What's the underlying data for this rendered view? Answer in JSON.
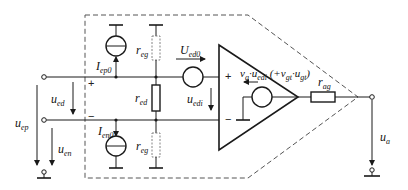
{
  "diagram": {
    "type": "op-amp equivalent circuit with offset sources",
    "colors": {
      "line": "#1a1a1a",
      "dashed": "#555555",
      "background": "#ffffff"
    },
    "labels": {
      "iep0": {
        "main": "I",
        "sub": "ep0"
      },
      "ien0": {
        "main": "I",
        "sub": "en0"
      },
      "reg_top": {
        "main": "r",
        "sub": "eg"
      },
      "reg_bottom": {
        "main": "r",
        "sub": "eg"
      },
      "red": {
        "main": "r",
        "sub": "ed"
      },
      "ued0": {
        "main": "U",
        "sub": "ed0"
      },
      "uedi": {
        "main": "u",
        "sub": "edi"
      },
      "ued": {
        "main": "u",
        "sub": "ed"
      },
      "uep": {
        "main": "u",
        "sub": "ep"
      },
      "uen": {
        "main": "u",
        "sub": "en"
      },
      "ua": {
        "main": "u",
        "sub": "a"
      },
      "rag": {
        "main": "r",
        "sub": "ag"
      },
      "gain_expr": "v_g·u_edi (+v_gt·u_gt)",
      "gain_main": "v",
      "gain_sub1": "g",
      "gain_mid": "·u",
      "gain_sub2": "edi",
      "gain_paren_open": " (+v",
      "gain_sub3": "gt",
      "gain_mid2": "·u",
      "gain_sub4": "gt",
      "gain_paren_close": ")"
    },
    "signs": {
      "input_plus": "+",
      "input_minus": "−",
      "opamp_plus": "+",
      "opamp_minus": "−"
    },
    "components": [
      "input offset current source I_ep0 (non-inverting)",
      "input offset current source I_en0 (inverting)",
      "common-mode resistor r_eg (top, dashed)",
      "common-mode resistor r_eg (bottom, dashed)",
      "differential input resistor r_ed",
      "offset voltage source U_ed0",
      "controlled voltage source v_g·u_edi",
      "output resistor r_ag",
      "op-amp triangle",
      "dashed boundary box"
    ]
  }
}
